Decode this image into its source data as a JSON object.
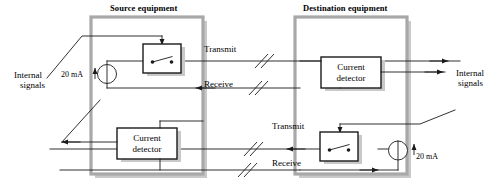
{
  "figure": {
    "type": "schematic-diagram",
    "width": 502,
    "height": 187,
    "background": "#ffffff",
    "line_color": "#1a1a1a",
    "panel_fill": "#ffffff",
    "panel_border_color": "#b5b5b5",
    "shadow_color": "#b8b8b8"
  },
  "panels": [
    {
      "id": "source",
      "title": "Source equipment"
    },
    {
      "id": "destination",
      "title": "Destination equipment"
    }
  ],
  "labels": {
    "internal_signals_left": "Internal\nsignals",
    "internal_signals_left_line1": "Internal",
    "internal_signals_left_line2": "signals",
    "internal_signals_right_line1": "Internal",
    "internal_signals_right_line2": "signals",
    "current_value_top": "20 mA",
    "current_value_bottom": "20 mA",
    "transmit_top": "Transmit",
    "receive_top": "Receive",
    "transmit_bottom": "Transmit",
    "receive_bottom": "Receive"
  },
  "blocks": [
    {
      "id": "source-transmit-switch",
      "kind": "switch",
      "panel": "source",
      "label_line1": "",
      "label_line2": ""
    },
    {
      "id": "source-current-detector",
      "kind": "current-detector",
      "panel": "source",
      "label_line1": "Current",
      "label_line2": "detector"
    },
    {
      "id": "destination-current-detector",
      "kind": "current-detector",
      "panel": "destination",
      "label_line1": "Current",
      "label_line2": "detector"
    },
    {
      "id": "destination-transmit-switch",
      "kind": "switch",
      "panel": "destination",
      "label_line1": "",
      "label_line2": ""
    }
  ],
  "sources": [
    {
      "id": "source-20ma",
      "panel": "source",
      "value": "20 mA",
      "direction": "up"
    },
    {
      "id": "destination-20ma",
      "panel": "destination",
      "value": "20 mA",
      "direction": "up"
    }
  ],
  "cables": [
    {
      "id": "top-transmit",
      "label": "Transmit",
      "from": "source",
      "to": "destination",
      "break_mark": true
    },
    {
      "id": "top-receive",
      "label": "Receive",
      "from": "destination",
      "to": "source",
      "break_mark": true
    },
    {
      "id": "bottom-transmit",
      "label": "Transmit",
      "from": "destination",
      "to": "source",
      "break_mark": true
    },
    {
      "id": "bottom-receive",
      "label": "Receive",
      "from": "source",
      "to": "destination",
      "break_mark": true
    }
  ]
}
